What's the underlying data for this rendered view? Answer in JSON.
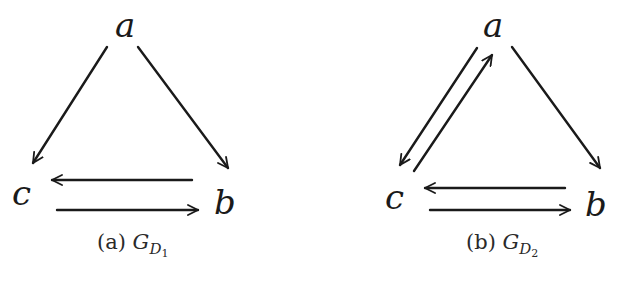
{
  "figures": [
    {
      "id": "a",
      "caption": {
        "prefix": "(a)",
        "symbol": "G",
        "sub": "D",
        "subsub": "1"
      },
      "nodes": {
        "a": "a",
        "b": "b",
        "c": "c"
      },
      "edges": [
        {
          "from": "a",
          "to": "c"
        },
        {
          "from": "a",
          "to": "b"
        },
        {
          "from": "b",
          "to": "c"
        },
        {
          "from": "c",
          "to": "b"
        }
      ]
    },
    {
      "id": "b",
      "caption": {
        "prefix": "(b)",
        "symbol": "G",
        "sub": "D",
        "subsub": "2"
      },
      "nodes": {
        "a": "a",
        "b": "b",
        "c": "c"
      },
      "edges": [
        {
          "from": "a",
          "to": "c"
        },
        {
          "from": "c",
          "to": "a"
        },
        {
          "from": "a",
          "to": "b"
        },
        {
          "from": "b",
          "to": "c"
        },
        {
          "from": "c",
          "to": "b"
        }
      ]
    }
  ],
  "colors": {
    "stroke": "#1a1a1a",
    "background": "#ffffff"
  }
}
